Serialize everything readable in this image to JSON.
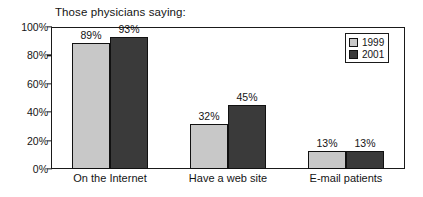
{
  "chart_data": {
    "type": "bar",
    "title": "Those physicians saying:",
    "xlabel": "",
    "ylabel": "",
    "ylim": [
      0,
      100
    ],
    "ytick_labels": [
      "100%",
      "80%",
      "60%",
      "40%",
      "20%",
      "0%"
    ],
    "ytick_values": [
      100,
      80,
      60,
      40,
      20,
      0
    ],
    "grid": false,
    "legend_position": "top-right",
    "categories": [
      "On the Internet",
      "Have a web site",
      "E-mail patients"
    ],
    "series": [
      {
        "name": "1999",
        "color": "#c8c8c8",
        "values": [
          89,
          32,
          13
        ],
        "labels": [
          "89%",
          "32%",
          "13%"
        ]
      },
      {
        "name": "2001",
        "color": "#3a3a3a",
        "values": [
          93,
          45,
          13
        ],
        "labels": [
          "93%",
          "45%",
          "13%"
        ]
      }
    ]
  },
  "legend": {
    "entries": [
      {
        "label": "1999",
        "swatch": "#c8c8c8"
      },
      {
        "label": "2001",
        "swatch": "#3a3a3a"
      }
    ]
  },
  "colors": {
    "series_1999": "#c8c8c8",
    "series_2001": "#3a3a3a",
    "axis": "#1a1a1a",
    "text": "#141414",
    "background": "#ffffff"
  }
}
